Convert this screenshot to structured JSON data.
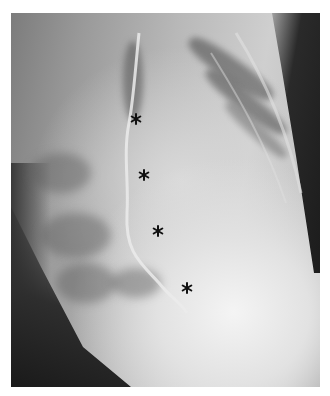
{
  "image": {
    "type": "lateral chest radiograph",
    "frame_color": "#ffffff",
    "markers": [
      {
        "label": "asterisk",
        "x": 136,
        "y": 119
      },
      {
        "label": "asterisk",
        "x": 144,
        "y": 175
      },
      {
        "label": "asterisk",
        "x": 158,
        "y": 231
      },
      {
        "label": "asterisk",
        "x": 187,
        "y": 288
      }
    ]
  }
}
